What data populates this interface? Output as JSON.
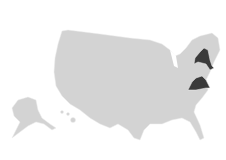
{
  "map": {
    "type": "choropleth",
    "region": "United States",
    "base_color": "#d3d3d3",
    "highlight_color": "#3a3a3a",
    "highlighted_states": [
      "New York",
      "Virginia"
    ]
  }
}
